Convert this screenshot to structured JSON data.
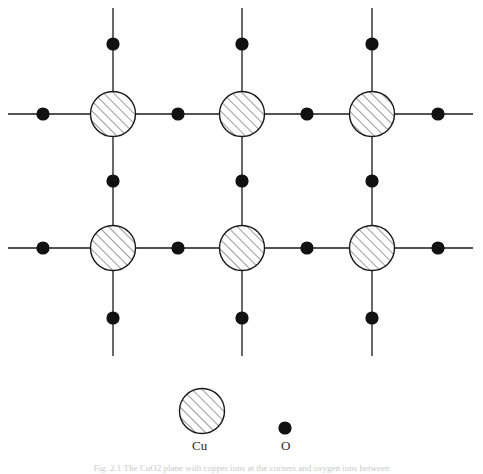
{
  "figure": {
    "caption": "Fig. 2.1 The CuO2 plane with copper ions at the corners and oxygen ions between",
    "background_color": "#ffffff",
    "line_color": "#1a1a1a"
  },
  "lattice": {
    "description": "Square lattice of copper ions connected by bonds with oxygen ions at bond midpoints",
    "columns_x": [
      113,
      242,
      372
    ],
    "rows_y": [
      114,
      248
    ],
    "cu_radius": 22.5,
    "o_radius": 6.5,
    "bond_line_width": 1.3,
    "horizontal_line_start_x": 8,
    "horizontal_line_end_x": 473,
    "vertical_line_start_y": 8,
    "vertical_line_end_y": 356,
    "oxygen_x_positions": [
      43,
      178,
      307,
      438
    ],
    "oxygen_y_positions": [
      44,
      181,
      318
    ],
    "cu_fill": "#ffffff",
    "cu_stroke": "#1a1a1a",
    "cu_hatch_color": "#4a4a4a",
    "o_fill": "#111111"
  },
  "legend": {
    "items": [
      {
        "symbol": "cu-hatched-circle",
        "label": "Cu",
        "cx": 202,
        "cy": 411,
        "r": 22.5
      },
      {
        "symbol": "o-filled-dot",
        "label": "O",
        "cx": 285,
        "cy": 428,
        "r": 6.5
      }
    ]
  }
}
